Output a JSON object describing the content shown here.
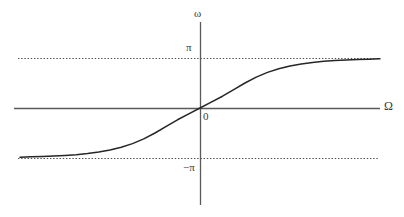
{
  "figure": {
    "background_color": "#ffffff",
    "width": 404,
    "height": 217
  },
  "labels": {
    "y_axis": "ω",
    "x_axis": "Ω",
    "upper_asymptote": "π",
    "lower_asymptote": "−π",
    "origin": "0"
  },
  "colors": {
    "curve": "#262626",
    "axis": "#5a5a5a",
    "asymptote": "#4d4d4d",
    "text": "#3a3a3a"
  },
  "chart_data": {
    "type": "line",
    "title": "",
    "xlabel": "Ω",
    "ylabel": "ω",
    "grid": false,
    "legend": false,
    "xlim": [
      -3.2,
      3.2
    ],
    "ylim": [
      -3.6,
      3.6
    ],
    "xticks": [
      0
    ],
    "xticklabels": [
      "0"
    ],
    "yticks": [
      -3.14159,
      0,
      3.14159
    ],
    "yticklabels": [
      "−π",
      "0",
      "π"
    ],
    "annotations": [
      {
        "text": "π",
        "kind": "asymptote-label",
        "y": 3.14159
      },
      {
        "text": "−π",
        "kind": "asymptote-label",
        "y": -3.14159
      },
      {
        "text": "0",
        "kind": "origin-label",
        "x": 0,
        "y": 0
      }
    ],
    "asymptotes": [
      {
        "orientation": "horizontal",
        "value": 3.14159,
        "style": "dotted",
        "label": "π"
      },
      {
        "orientation": "horizontal",
        "value": -3.14159,
        "style": "dotted",
        "label": "−π"
      }
    ],
    "series": [
      {
        "name": "phase",
        "style": "solid",
        "x": [
          -3.2,
          -3.0,
          -2.8,
          -2.6,
          -2.4,
          -2.2,
          -2.0,
          -1.8,
          -1.6,
          -1.4,
          -1.2,
          -1.0,
          -0.8,
          -0.6,
          -0.4,
          -0.2,
          0.0,
          0.2,
          0.4,
          0.6,
          0.8,
          1.0,
          1.2,
          1.4,
          1.6,
          1.8,
          2.0,
          2.2,
          2.4,
          2.6,
          2.8,
          3.0,
          3.2
        ],
        "y": [
          -3.09,
          -3.07,
          -3.05,
          -3.02,
          -2.98,
          -2.93,
          -2.86,
          -2.77,
          -2.64,
          -2.47,
          -2.24,
          -1.94,
          -1.57,
          -1.15,
          -0.74,
          -0.37,
          0.0,
          0.37,
          0.74,
          1.15,
          1.57,
          1.94,
          2.24,
          2.47,
          2.64,
          2.77,
          2.86,
          2.93,
          2.98,
          3.02,
          3.05,
          3.07,
          3.09
        ]
      }
    ]
  },
  "geometry": {
    "origin_px": {
      "x": 200,
      "y": 108
    },
    "x_axis": {
      "x1": 14,
      "x2": 380,
      "y": 108
    },
    "y_axis": {
      "x": 200,
      "y1": 22,
      "y2": 205
    },
    "upper_asymptote_px": {
      "y": 58,
      "x1": 18,
      "x2": 378
    },
    "lower_asymptote_px": {
      "y": 158,
      "x1": 18,
      "x2": 378
    }
  }
}
